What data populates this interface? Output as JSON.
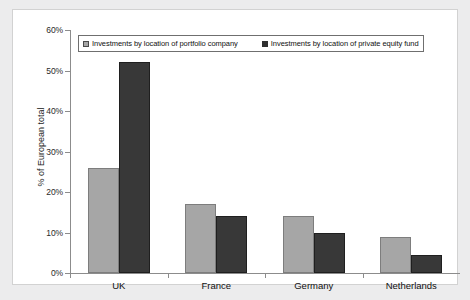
{
  "chart_data": {
    "type": "bar",
    "title": "",
    "xlabel": "",
    "ylabel": "% of European total",
    "ylim": [
      0,
      60
    ],
    "ytick_labels": [
      "0%",
      "10%",
      "20%",
      "30%",
      "40%",
      "50%",
      "60%"
    ],
    "ytick_values": [
      0,
      10,
      20,
      30,
      40,
      50,
      60
    ],
    "grid": false,
    "legend_position": "top-left-inside",
    "categories": [
      "UK",
      "France",
      "Germany",
      "Netherlands"
    ],
    "series": [
      {
        "name": "Investments by location of portfolio company",
        "color": "#a6a6a6",
        "values": [
          26,
          17,
          14,
          9
        ]
      },
      {
        "name": "Investments by location of private equity fund",
        "color": "#383838",
        "values": [
          52,
          14,
          10,
          4.5
        ]
      }
    ]
  }
}
